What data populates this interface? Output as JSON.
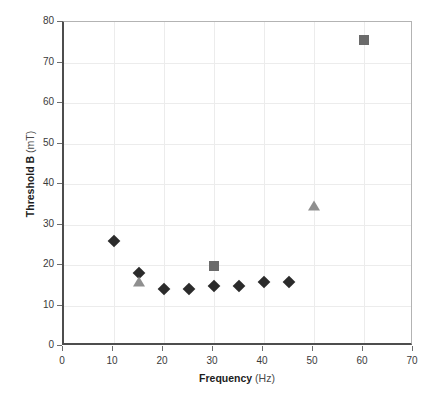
{
  "chart_data": {
    "type": "scatter",
    "title": "",
    "xlabel": "Frequency",
    "xunit": "(Hz)",
    "ylabel": "Threshold B",
    "yunit": "(mT)",
    "xlim": [
      0,
      70
    ],
    "ylim": [
      0,
      80
    ],
    "xticks": [
      0,
      10,
      20,
      30,
      40,
      50,
      60,
      70
    ],
    "yticks": [
      0,
      10,
      20,
      30,
      40,
      50,
      60,
      70,
      80
    ],
    "grid": true,
    "legend": "none",
    "series": [
      {
        "name": "diamond-series",
        "marker": "diamond",
        "color": "#2b2b2b",
        "points": [
          {
            "x": 10,
            "y": 26.0
          },
          {
            "x": 15,
            "y": 18.0
          },
          {
            "x": 20,
            "y": 14.0
          },
          {
            "x": 25,
            "y": 14.0
          },
          {
            "x": 30,
            "y": 14.8
          },
          {
            "x": 35,
            "y": 14.8
          },
          {
            "x": 40,
            "y": 15.8
          },
          {
            "x": 45,
            "y": 15.7
          }
        ]
      },
      {
        "name": "square-series",
        "marker": "square",
        "color": "#6b6b6b",
        "points": [
          {
            "x": 30,
            "y": 19.8
          },
          {
            "x": 60,
            "y": 75.5
          }
        ]
      },
      {
        "name": "triangle-series",
        "marker": "triangle",
        "color": "#8f8f8f",
        "points": [
          {
            "x": 15,
            "y": 15.8
          },
          {
            "x": 50,
            "y": 34.6
          }
        ]
      }
    ]
  },
  "axes": {
    "x_tick_labels": [
      "0",
      "10",
      "20",
      "30",
      "40",
      "50",
      "60",
      "70"
    ],
    "y_tick_labels": [
      "0",
      "10",
      "20",
      "30",
      "40",
      "50",
      "60",
      "70",
      "80"
    ],
    "x_title_main": "Frequency",
    "x_title_unit": "(Hz)",
    "y_title_main": "Threshold B",
    "y_title_unit": "(mT)"
  }
}
